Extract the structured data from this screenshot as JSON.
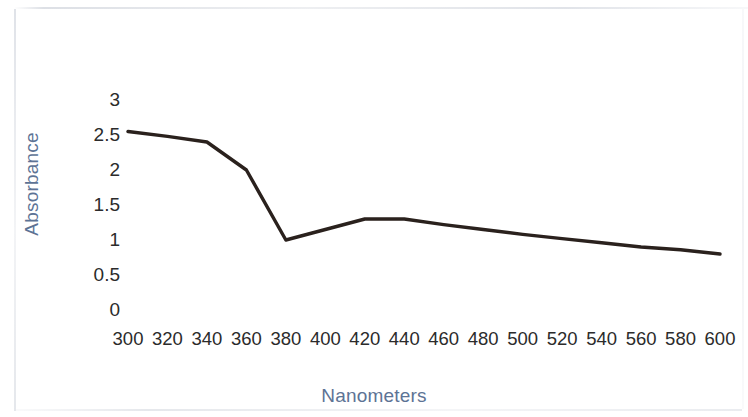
{
  "chart_data": {
    "type": "line",
    "title": "",
    "xlabel": "Nanometers",
    "ylabel": "Absorbance",
    "xlim": [
      300,
      600
    ],
    "ylim": [
      0,
      3
    ],
    "x_tick_labels": [
      "300",
      "320",
      "340",
      "360",
      "380",
      "400",
      "420",
      "440",
      "460",
      "480",
      "500",
      "520",
      "540",
      "560",
      "580",
      "600"
    ],
    "y_tick_labels": [
      "3",
      "2.5",
      "2",
      "1.5",
      "1",
      "0.5",
      "0"
    ],
    "y_tick_values": [
      3,
      2.5,
      2,
      1.5,
      1,
      0.5,
      0
    ],
    "grid": false,
    "legend": "none",
    "series": [
      {
        "name": "Absorbance",
        "color": "#2a211d",
        "x": [
          300,
          320,
          340,
          360,
          380,
          400,
          420,
          440,
          460,
          480,
          500,
          520,
          540,
          560,
          580,
          600
        ],
        "values": [
          2.55,
          2.48,
          2.4,
          2.0,
          1.0,
          1.15,
          1.3,
          1.3,
          1.22,
          1.15,
          1.08,
          1.02,
          0.96,
          0.9,
          0.86,
          0.8
        ]
      }
    ]
  },
  "axes": {
    "x_title": "Nanometers",
    "y_title": "Absorbance",
    "title_color": "#5d7395",
    "tick_color": "#2b2b2b"
  }
}
